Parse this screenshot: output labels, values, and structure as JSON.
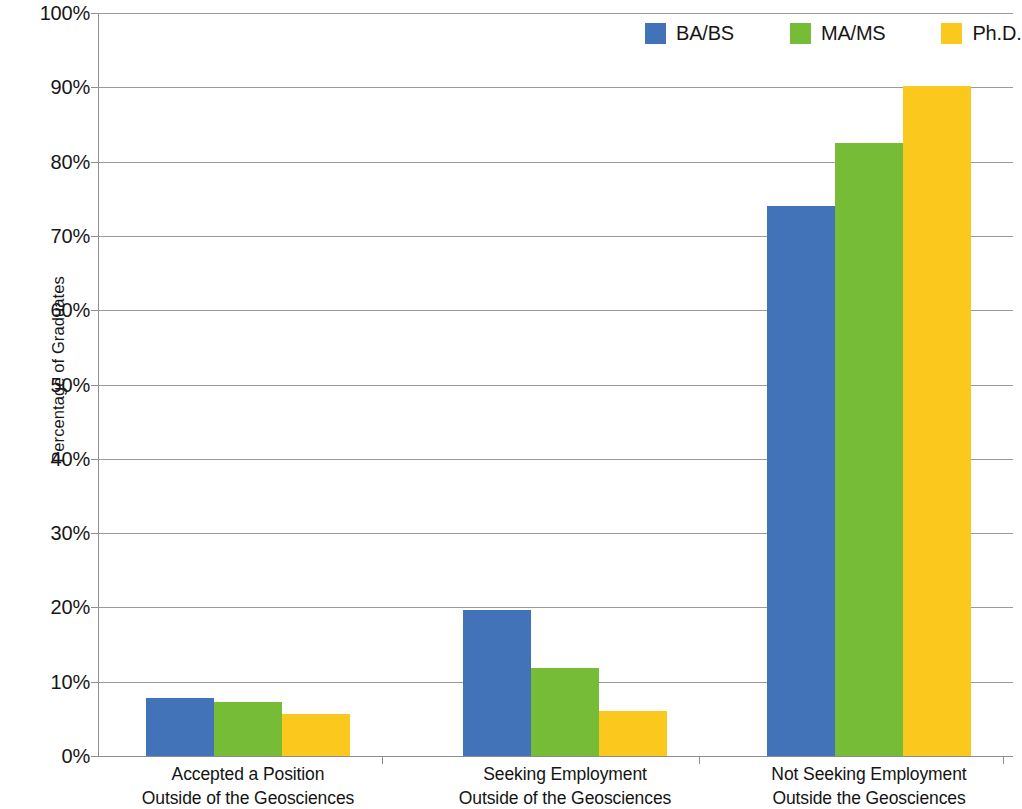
{
  "chart_data": {
    "type": "bar",
    "title": "",
    "xlabel": "",
    "ylabel": "Percentage of Graduates",
    "ylim": [
      0,
      100
    ],
    "ytick_labels": [
      "100%",
      "90%",
      "80%",
      "70%",
      "60%",
      "50%",
      "40%",
      "30%",
      "20%",
      "10%",
      "0%"
    ],
    "ytick_values": [
      100,
      90,
      80,
      70,
      60,
      50,
      40,
      30,
      20,
      10,
      0
    ],
    "grid": true,
    "legend_position": "top-right",
    "categories": [
      "Accepted a Position Outside of the Geosciences",
      "Seeking Employment Outside of the Geosciences",
      "Not Seeking Employment Outside the Geosciences"
    ],
    "category_lines": [
      {
        "line1": "Accepted a Position",
        "line2": "Outside of the Geosciences"
      },
      {
        "line1": "Seeking Employment",
        "line2": "Outside of the Geosciences"
      },
      {
        "line1": "Not Seeking Employment",
        "line2": "Outside the Geosciences"
      }
    ],
    "series": [
      {
        "name": "BA/BS",
        "color": "#4273B8",
        "values": [
          7.8,
          19.7,
          74.0
        ]
      },
      {
        "name": "MA/MS",
        "color": "#77BC36",
        "values": [
          7.3,
          11.9,
          82.5
        ]
      },
      {
        "name": "Ph.D.",
        "color": "#FBC81E",
        "values": [
          5.7,
          6.1,
          90.2
        ]
      }
    ]
  },
  "legend": {
    "items": [
      {
        "label": "BA/BS",
        "color": "#4273B8"
      },
      {
        "label": "MA/MS",
        "color": "#77BC36"
      },
      {
        "label": "Ph.D.",
        "color": "#FBC81E"
      }
    ]
  },
  "axes": {
    "y_title": "Percentage of Graduates"
  }
}
